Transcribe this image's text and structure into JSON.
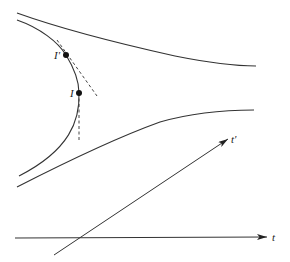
{
  "diagram": {
    "title": "",
    "labels": {
      "event_I_prime": "I'",
      "event_I": "I",
      "axis_t_prime": "t'",
      "axis_t": "t"
    },
    "colors": {
      "stroke": "#333333",
      "point": "#111111",
      "background": "#ffffff"
    },
    "elements": [
      {
        "name": "upper-worldline",
        "type": "curve",
        "style": "solid"
      },
      {
        "name": "left-hyperbola-worldline",
        "type": "curve",
        "style": "solid"
      },
      {
        "name": "lower-worldline",
        "type": "curve",
        "style": "solid"
      },
      {
        "name": "tangent-at-I-prime",
        "type": "line",
        "style": "dashed"
      },
      {
        "name": "tangent-at-I",
        "type": "line",
        "style": "dashed"
      },
      {
        "name": "t-prime-axis",
        "type": "arrow",
        "label": "t'"
      },
      {
        "name": "t-axis",
        "type": "arrow",
        "label": "t"
      },
      {
        "name": "event-I-prime",
        "type": "point",
        "label": "I'"
      },
      {
        "name": "event-I",
        "type": "point",
        "label": "I"
      }
    ]
  }
}
